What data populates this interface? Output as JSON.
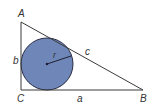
{
  "diagram": {
    "type": "right-triangle-incircle",
    "colors": {
      "stroke": "#3a3a3a",
      "circle_fill": "#6f86b8",
      "circle_stroke": "#2b2f45",
      "text": "#333333"
    },
    "vertices": {
      "A": {
        "label": "A",
        "x": 21,
        "y": 22
      },
      "B": {
        "label": "B",
        "x": 143,
        "y": 90
      },
      "C": {
        "label": "C",
        "x": 21,
        "y": 90
      }
    },
    "sides": {
      "a": "a",
      "b": "b",
      "c": "c"
    },
    "incircle": {
      "cx": 47,
      "cy": 64,
      "r": 26,
      "radius_label": "r"
    }
  }
}
